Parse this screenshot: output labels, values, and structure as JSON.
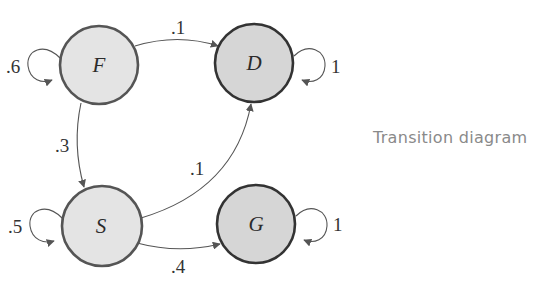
{
  "caption": "Transition diagram",
  "colors": {
    "transient_fill": "#e4e4e4",
    "transient_stroke": "#555555",
    "absorbing_fill": "#d6d6d6",
    "absorbing_stroke": "#333333",
    "edge": "#555555",
    "caption": "#8a8a8a"
  },
  "states": [
    {
      "id": "F",
      "label": "F",
      "type": "transient"
    },
    {
      "id": "D",
      "label": "D",
      "type": "absorbing"
    },
    {
      "id": "S",
      "label": "S",
      "type": "transient"
    },
    {
      "id": "G",
      "label": "G",
      "type": "absorbing"
    }
  ],
  "transitions": [
    {
      "from": "F",
      "to": "F",
      "label": ".6"
    },
    {
      "from": "F",
      "to": "D",
      "label": ".1"
    },
    {
      "from": "F",
      "to": "S",
      "label": ".3"
    },
    {
      "from": "D",
      "to": "D",
      "label": "1"
    },
    {
      "from": "S",
      "to": "S",
      "label": ".5"
    },
    {
      "from": "S",
      "to": "D",
      "label": ".1"
    },
    {
      "from": "S",
      "to": "G",
      "label": ".4"
    },
    {
      "from": "G",
      "to": "G",
      "label": "1"
    }
  ]
}
